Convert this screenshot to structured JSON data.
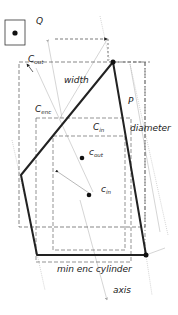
{
  "diagram": {
    "labels": {
      "q": "Q",
      "c_out_main": "C",
      "c_out_sub": "out",
      "width": "width",
      "p": "P",
      "c_enc_main": "C",
      "c_enc_sub": "enc",
      "c_in_main": "C",
      "c_in_sub": "in",
      "diameter": "diameter",
      "c_out_point_main": "c",
      "c_out_point_sub": "out",
      "c_in_point_main": "c",
      "c_in_point_sub": "in",
      "min_enc_cylinder": "min enc cylinder",
      "axis": "axis"
    },
    "colors": {
      "polygon": "#222222",
      "dashed": "#666666",
      "faint": "#b0b0b0",
      "point": "#111111"
    }
  }
}
